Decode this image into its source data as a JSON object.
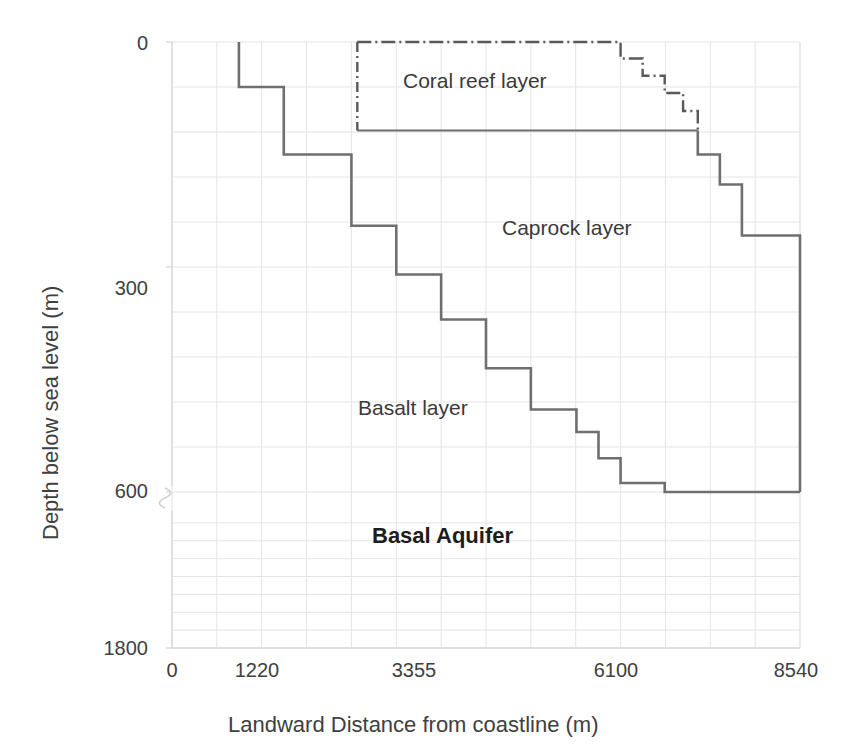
{
  "chart_data": {
    "type": "line",
    "title": "",
    "xlabel": "Landward Distance from coastline (m)",
    "ylabel": "Depth below sea level (m)",
    "xlim": [
      0,
      8540
    ],
    "ylim": [
      0,
      1800
    ],
    "grid": true,
    "legend_position": "none",
    "axis_break": {
      "present": true,
      "between": [
        600,
        1800
      ],
      "axis": "y"
    },
    "xticks": [
      {
        "value": 0,
        "label": "0"
      },
      {
        "value": 1220,
        "label": "1220"
      },
      {
        "value": 3355,
        "label": "3355"
      },
      {
        "value": 6100,
        "label": "6100"
      },
      {
        "value": 8540,
        "label": "8540"
      }
    ],
    "yticks": [
      {
        "value": 0,
        "label": "0"
      },
      {
        "value": 300,
        "label": "300"
      },
      {
        "value": 600,
        "label": "600"
      },
      {
        "value": 1800,
        "label": "1800"
      }
    ],
    "annotations": [
      {
        "text": "Coral reef layer",
        "x": 3100,
        "y": 55,
        "bold": false
      },
      {
        "text": "Caprock layer",
        "x": 5250,
        "y": 215,
        "bold": false
      },
      {
        "text": "Basalt layer",
        "x": 3150,
        "y": 430,
        "bold": false
      },
      {
        "text": "Basal Aquifer",
        "x": 3400,
        "y": 720,
        "bold": true
      }
    ],
    "series": [
      {
        "name": "Coral reef layer top",
        "style": "dash-dot",
        "color": "#595959",
        "points": [
          [
            2520,
            0
          ],
          [
            6100,
            0
          ],
          [
            6100,
            22
          ],
          [
            6400,
            22
          ],
          [
            6400,
            45
          ],
          [
            6700,
            45
          ],
          [
            6700,
            68
          ],
          [
            6950,
            68
          ],
          [
            6950,
            92
          ],
          [
            7150,
            92
          ],
          [
            7150,
            118
          ]
        ]
      },
      {
        "name": "Caprock layer top (coral reef base)",
        "style": "solid-thin",
        "color": "#6f6f6f",
        "points": [
          [
            2520,
            118
          ],
          [
            2520,
            0
          ],
          [
            2520,
            118
          ],
          [
            7150,
            118
          ]
        ]
      },
      {
        "name": "Basalt layer top",
        "style": "solid-thick",
        "color": "#6f6f6f",
        "points": [
          [
            910,
            0
          ],
          [
            910,
            60
          ],
          [
            1520,
            60
          ],
          [
            1520,
            150
          ],
          [
            2440,
            150
          ],
          [
            2440,
            245
          ],
          [
            3050,
            245
          ],
          [
            3050,
            310
          ],
          [
            3660,
            310
          ],
          [
            3660,
            370
          ],
          [
            4270,
            370
          ],
          [
            4270,
            435
          ],
          [
            4880,
            435
          ],
          [
            4880,
            490
          ],
          [
            5500,
            490
          ],
          [
            5500,
            520
          ],
          [
            5800,
            520
          ],
          [
            5800,
            555
          ],
          [
            6100,
            555
          ],
          [
            6100,
            588
          ],
          [
            6700,
            588
          ],
          [
            6700,
            600
          ],
          [
            8540,
            600
          ]
        ]
      },
      {
        "name": "Caprock layer base (right flank)",
        "style": "solid-thick",
        "color": "#6f6f6f",
        "points": [
          [
            7150,
            118
          ],
          [
            7150,
            150
          ],
          [
            7450,
            150
          ],
          [
            7450,
            190
          ],
          [
            7750,
            190
          ],
          [
            7750,
            258
          ],
          [
            8540,
            258
          ],
          [
            8540,
            600
          ]
        ]
      }
    ]
  }
}
